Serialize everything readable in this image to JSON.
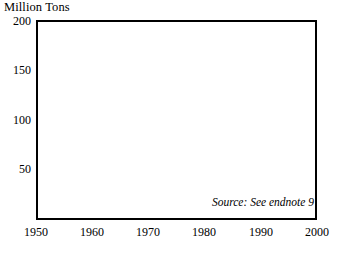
{
  "chart_data": {
    "type": "line",
    "title": "Million Tons",
    "xlabel": "",
    "ylabel": "Million Tons",
    "xlim": [
      1950,
      2000
    ],
    "ylim": [
      0,
      200
    ],
    "yticks": [
      50,
      100,
      150,
      200
    ],
    "xticks": [
      1950,
      1960,
      1970,
      1980,
      1990,
      2000
    ],
    "grid": "horizontal",
    "legend": "none",
    "annotation": "Source: See endnote 9",
    "line_color": "#000000",
    "x": [
      1950,
      1951,
      1952,
      1953,
      1954,
      1955,
      1956,
      1957,
      1958,
      1959,
      1960,
      1961,
      1962,
      1963,
      1964,
      1965,
      1966,
      1967,
      1968,
      1969,
      1970,
      1971,
      1972,
      1973,
      1974,
      1975,
      1976,
      1977,
      1978,
      1979,
      1980,
      1981,
      1982,
      1983,
      1984,
      1985,
      1986,
      1987,
      1988,
      1989,
      1990,
      1991,
      1992,
      1993,
      1994,
      1995
    ],
    "values": [
      47,
      51,
      54,
      56,
      59,
      62,
      65,
      67,
      68,
      71,
      71,
      70,
      74,
      77,
      82,
      85,
      89,
      93,
      97,
      98,
      100,
      102,
      105,
      104,
      104,
      105,
      110,
      112,
      115,
      118,
      122,
      124,
      124,
      126,
      133,
      137,
      143,
      146,
      152,
      158,
      162,
      166,
      172,
      178,
      186,
      194
    ],
    "units": "million tons",
    "series": [
      {
        "name": "Million Tons",
        "values": [
          47,
          51,
          54,
          56,
          59,
          62,
          65,
          67,
          68,
          71,
          71,
          70,
          74,
          77,
          82,
          85,
          89,
          93,
          97,
          98,
          100,
          102,
          105,
          104,
          104,
          105,
          110,
          112,
          115,
          118,
          122,
          124,
          124,
          126,
          133,
          137,
          143,
          146,
          152,
          158,
          162,
          166,
          172,
          178,
          186,
          194
        ]
      }
    ]
  },
  "labels": {
    "y": [
      "200",
      "150",
      "100",
      "50"
    ],
    "x": [
      "1950",
      "1960",
      "1970",
      "1980",
      "1990",
      "2000"
    ]
  }
}
